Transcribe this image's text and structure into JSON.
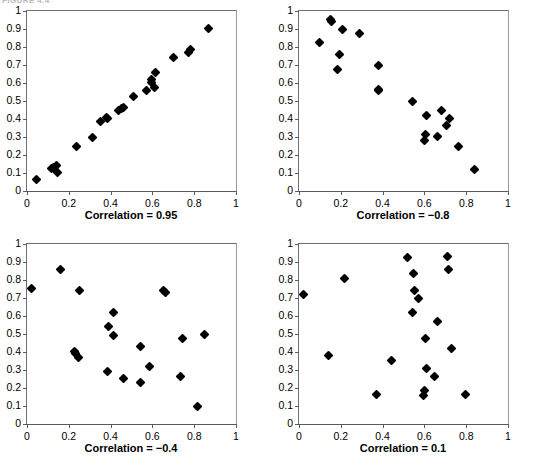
{
  "figure": {
    "bleed_caption": "FIGURE 4.4",
    "axis": {
      "x_ticks": [
        "0",
        "0.2",
        "0.4",
        "0.6",
        "0.8",
        "1"
      ],
      "x_tick_values": [
        0,
        0.2,
        0.4,
        0.6,
        0.8,
        1
      ],
      "y_ticks": [
        "0",
        "0.1",
        "0.2",
        "0.3",
        "0.4",
        "0.5",
        "0.6",
        "0.7",
        "0.8",
        "0.9",
        "1"
      ],
      "y_tick_values": [
        0,
        0.1,
        0.2,
        0.3,
        0.4,
        0.5,
        0.6,
        0.7,
        0.8,
        0.9,
        1
      ]
    },
    "marker_color": "#000000",
    "axis_color": "#5a5a5a"
  },
  "chart_data": [
    {
      "type": "scatter",
      "title": "Correlation = 0.95",
      "panel": "top-left",
      "xlabel": "",
      "ylabel": "",
      "xlim": [
        0,
        1
      ],
      "ylim": [
        0,
        1
      ],
      "grid": false,
      "legend": "none",
      "marker": "diamond",
      "correlation": 0.95,
      "points": [
        [
          0.047,
          0.064
        ],
        [
          0.118,
          0.124
        ],
        [
          0.127,
          0.128
        ],
        [
          0.143,
          0.144
        ],
        [
          0.146,
          0.103
        ],
        [
          0.236,
          0.246
        ],
        [
          0.315,
          0.299
        ],
        [
          0.352,
          0.388
        ],
        [
          0.379,
          0.41
        ],
        [
          0.387,
          0.403
        ],
        [
          0.437,
          0.447
        ],
        [
          0.451,
          0.458
        ],
        [
          0.461,
          0.466
        ],
        [
          0.509,
          0.524
        ],
        [
          0.57,
          0.558
        ],
        [
          0.594,
          0.618
        ],
        [
          0.598,
          0.604
        ],
        [
          0.612,
          0.577
        ],
        [
          0.617,
          0.661
        ],
        [
          0.702,
          0.744
        ],
        [
          0.772,
          0.769
        ],
        [
          0.781,
          0.786
        ],
        [
          0.868,
          0.901
        ]
      ]
    },
    {
      "type": "scatter",
      "title": "Correlation = −0.8",
      "panel": "top-right",
      "xlabel": "",
      "ylabel": "",
      "xlim": [
        0,
        1
      ],
      "ylim": [
        0,
        1
      ],
      "grid": false,
      "legend": "none",
      "marker": "diamond",
      "correlation": -0.8,
      "points": [
        [
          0.098,
          0.827
        ],
        [
          0.152,
          0.951
        ],
        [
          0.156,
          0.943
        ],
        [
          0.186,
          0.676
        ],
        [
          0.196,
          0.758
        ],
        [
          0.208,
          0.898
        ],
        [
          0.288,
          0.873
        ],
        [
          0.378,
          0.697
        ],
        [
          0.379,
          0.563
        ],
        [
          0.381,
          0.557
        ],
        [
          0.541,
          0.5
        ],
        [
          0.6,
          0.283
        ],
        [
          0.606,
          0.316
        ],
        [
          0.61,
          0.421
        ],
        [
          0.664,
          0.302
        ],
        [
          0.681,
          0.447
        ],
        [
          0.707,
          0.364
        ],
        [
          0.722,
          0.404
        ],
        [
          0.762,
          0.249
        ],
        [
          0.838,
          0.122
        ]
      ]
    },
    {
      "type": "scatter",
      "title": "Correlation = −0.4",
      "panel": "bottom-left",
      "xlabel": "",
      "ylabel": "",
      "xlim": [
        0,
        1
      ],
      "ylim": [
        0,
        1
      ],
      "grid": false,
      "legend": "none",
      "marker": "diamond",
      "correlation": -0.4,
      "points": [
        [
          0.02,
          0.754
        ],
        [
          0.159,
          0.858
        ],
        [
          0.227,
          0.404
        ],
        [
          0.234,
          0.393
        ],
        [
          0.248,
          0.369
        ],
        [
          0.253,
          0.744
        ],
        [
          0.387,
          0.291
        ],
        [
          0.392,
          0.54
        ],
        [
          0.412,
          0.617
        ],
        [
          0.416,
          0.489
        ],
        [
          0.464,
          0.255
        ],
        [
          0.544,
          0.228
        ],
        [
          0.545,
          0.433
        ],
        [
          0.585,
          0.318
        ],
        [
          0.655,
          0.742
        ],
        [
          0.664,
          0.733
        ],
        [
          0.733,
          0.262
        ],
        [
          0.744,
          0.474
        ],
        [
          0.818,
          0.097
        ],
        [
          0.851,
          0.499
        ]
      ]
    },
    {
      "type": "scatter",
      "title": "Correlation = 0.1",
      "panel": "bottom-right",
      "xlabel": "",
      "ylabel": "",
      "xlim": [
        0,
        1
      ],
      "ylim": [
        0,
        1
      ],
      "grid": false,
      "legend": "none",
      "marker": "diamond",
      "correlation": 0.1,
      "points": [
        [
          0.021,
          0.717
        ],
        [
          0.143,
          0.378
        ],
        [
          0.216,
          0.808
        ],
        [
          0.369,
          0.162
        ],
        [
          0.441,
          0.355
        ],
        [
          0.518,
          0.927
        ],
        [
          0.545,
          0.618
        ],
        [
          0.549,
          0.836
        ],
        [
          0.551,
          0.742
        ],
        [
          0.573,
          0.696
        ],
        [
          0.598,
          0.157
        ],
        [
          0.6,
          0.186
        ],
        [
          0.603,
          0.474
        ],
        [
          0.608,
          0.311
        ],
        [
          0.648,
          0.266
        ],
        [
          0.661,
          0.568
        ],
        [
          0.71,
          0.928
        ],
        [
          0.716,
          0.858
        ],
        [
          0.728,
          0.417
        ],
        [
          0.798,
          0.166
        ]
      ]
    }
  ]
}
